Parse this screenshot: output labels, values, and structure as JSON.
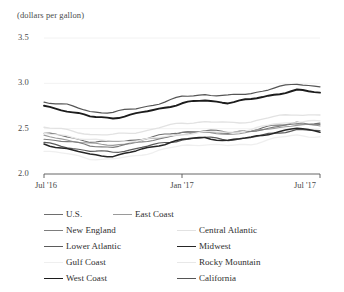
{
  "chart_data": {
    "type": "line",
    "title": "",
    "subtitle": "",
    "unit_label": "(dollars per gallon)",
    "xlabel": "",
    "ylabel": "",
    "ylim": [
      2.0,
      3.5
    ],
    "yticks": [
      2.0,
      2.5,
      3.0,
      3.5
    ],
    "ytick_labels": [
      "2.0",
      "2.5",
      "3.0",
      "3.5"
    ],
    "xticks": [
      "Jul '16",
      "Jan '17",
      "Jul '17"
    ],
    "xtick_labels": [
      "Jul '16",
      "Jan '17",
      "Jul '17"
    ],
    "xlim": [
      "Jul '16",
      "Jul '17"
    ],
    "grid": true,
    "grid_axis": "y",
    "legend_position": "bottom",
    "legend_columns": 2,
    "x": [
      "2016-07",
      "2016-08",
      "2016-09",
      "2016-10",
      "2016-11",
      "2016-12",
      "2017-01",
      "2017-02",
      "2017-03",
      "2017-04",
      "2017-05",
      "2017-06",
      "2017-07"
    ],
    "series": [
      {
        "name": "U.S.",
        "color": "#6e6e6e",
        "width": 1.1,
        "values": [
          2.45,
          2.41,
          2.36,
          2.35,
          2.38,
          2.42,
          2.46,
          2.48,
          2.46,
          2.48,
          2.53,
          2.56,
          2.55
        ]
      },
      {
        "name": "East Coast",
        "color": "#9a9a9a",
        "width": 1.1,
        "values": [
          2.42,
          2.38,
          2.33,
          2.32,
          2.35,
          2.4,
          2.44,
          2.46,
          2.44,
          2.46,
          2.51,
          2.54,
          2.53
        ]
      },
      {
        "name": "New England",
        "color": "#7d7d7d",
        "width": 1.1,
        "values": [
          2.39,
          2.36,
          2.31,
          2.3,
          2.34,
          2.39,
          2.45,
          2.47,
          2.45,
          2.47,
          2.52,
          2.56,
          2.55
        ]
      },
      {
        "name": "Central Atlantic",
        "color": "#e2e2e2",
        "width": 1.3,
        "values": [
          2.52,
          2.48,
          2.44,
          2.43,
          2.46,
          2.51,
          2.56,
          2.58,
          2.56,
          2.58,
          2.63,
          2.66,
          2.65
        ]
      },
      {
        "name": "Lower Atlantic",
        "color": "#5b5b5b",
        "width": 1.2,
        "values": [
          2.34,
          2.3,
          2.25,
          2.24,
          2.28,
          2.33,
          2.38,
          2.4,
          2.38,
          2.4,
          2.45,
          2.49,
          2.47
        ]
      },
      {
        "name": "Midwest",
        "color": "#262626",
        "width": 1.5,
        "values": [
          2.33,
          2.28,
          2.21,
          2.2,
          2.25,
          2.32,
          2.38,
          2.4,
          2.37,
          2.4,
          2.46,
          2.5,
          2.47
        ]
      },
      {
        "name": "Gulf Coast",
        "color": "#efefef",
        "width": 1.3,
        "values": [
          2.26,
          2.22,
          2.17,
          2.16,
          2.2,
          2.26,
          2.31,
          2.33,
          2.31,
          2.33,
          2.39,
          2.43,
          2.41
        ]
      },
      {
        "name": "Rocky Mountain",
        "color": "#e8e8e8",
        "width": 1.3,
        "values": [
          2.44,
          2.42,
          2.38,
          2.36,
          2.37,
          2.4,
          2.44,
          2.46,
          2.46,
          2.49,
          2.55,
          2.58,
          2.58
        ]
      },
      {
        "name": "West Coast",
        "color": "#1c1c1c",
        "width": 1.9,
        "values": [
          2.75,
          2.7,
          2.63,
          2.62,
          2.66,
          2.72,
          2.78,
          2.81,
          2.79,
          2.82,
          2.88,
          2.92,
          2.9
        ]
      },
      {
        "name": "California",
        "color": "#555555",
        "width": 1.2,
        "values": [
          2.8,
          2.76,
          2.69,
          2.68,
          2.72,
          2.78,
          2.85,
          2.88,
          2.86,
          2.89,
          2.95,
          2.99,
          2.97
        ]
      }
    ]
  },
  "legend": {
    "rows": [
      [
        {
          "label": "U.S.",
          "color": "#6e6e6e",
          "width": 1.1,
          "x": 44
        },
        {
          "label": "East Coast",
          "color": "#9a9a9a",
          "width": 1.1,
          "x": 113
        }
      ],
      [
        {
          "label": "New England",
          "color": "#7d7d7d",
          "width": 1.1,
          "x": 44
        },
        {
          "label": "Central Atlantic",
          "color": "#e2e2e2",
          "width": 1.3,
          "x": 177
        }
      ],
      [
        {
          "label": "Lower Atlantic",
          "color": "#5b5b5b",
          "width": 1.2,
          "x": 44
        },
        {
          "label": "Midwest",
          "color": "#262626",
          "width": 1.5,
          "x": 177
        }
      ],
      [
        {
          "label": "Gulf Coast",
          "color": "#efefef",
          "width": 1.3,
          "x": 44
        },
        {
          "label": "Rocky Mountain",
          "color": "#e8e8e8",
          "width": 1.3,
          "x": 177
        }
      ],
      [
        {
          "label": "West Coast",
          "color": "#1c1c1c",
          "width": 1.9,
          "x": 44
        },
        {
          "label": "California",
          "color": "#555555",
          "width": 1.2,
          "x": 177
        }
      ]
    ]
  },
  "style": {
    "axis_color": "#555555",
    "grid_color": "#f2f2f2",
    "text_color": "#3a3a3a",
    "background": "#ffffff"
  }
}
